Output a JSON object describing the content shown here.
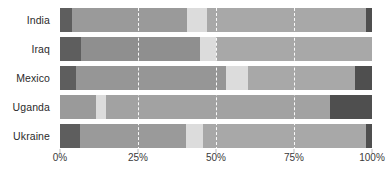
{
  "chart_data": {
    "type": "bar",
    "orientation": "horizontal",
    "stacked": true,
    "normalized": "100%",
    "title": "",
    "subtitle": "",
    "xlabel": "",
    "ylabel": "",
    "xlim": [
      0,
      100
    ],
    "xticks": [
      0,
      25,
      50,
      75,
      100
    ],
    "xticklabels": [
      "0%",
      "25%",
      "50%",
      "75%",
      "100%"
    ],
    "grid": "dashed white vertical gridlines at 25%, 50%, 75%",
    "legend": "none",
    "categories": [
      "India",
      "Iraq",
      "Mexico",
      "Uganda",
      "Ukraine"
    ],
    "series": [
      {
        "name": "Segment 1",
        "color": "#5e5e5e",
        "values": [
          3.8,
          6.7,
          5.1,
          0,
          6.4
        ]
      },
      {
        "name": "Segment 2",
        "color": "#9a9a9a",
        "values": [
          36.9,
          38.2,
          48.1,
          11.5,
          34.0
        ]
      },
      {
        "name": "Segment 3",
        "color": "#dcdcdc",
        "values": [
          6.4,
          5.1,
          7.1,
          3.2,
          5.4
        ]
      },
      {
        "name": "Segment 4",
        "color": "#a8a8a8",
        "values": [
          51.0,
          50.0,
          34.6,
          71.8,
          52.2
        ]
      },
      {
        "name": "Segment 5",
        "color": "#4f4f4f",
        "values": [
          1.9,
          0,
          5.1,
          13.5,
          2.0
        ]
      }
    ],
    "bars": [
      {
        "category": "India",
        "segments": [
          {
            "series": "Segment 1",
            "value": 3.8,
            "start": 0,
            "end": 3.8,
            "color": "#5e5e5e"
          },
          {
            "series": "Segment 2",
            "value": 36.9,
            "start": 3.8,
            "end": 40.7,
            "color": "#9a9a9a"
          },
          {
            "series": "Segment 3",
            "value": 6.4,
            "start": 40.7,
            "end": 47.1,
            "color": "#dcdcdc"
          },
          {
            "series": "Segment 4",
            "value": 51.0,
            "start": 47.1,
            "end": 98.1,
            "color": "#a8a8a8"
          },
          {
            "series": "Segment 5",
            "value": 1.9,
            "start": 98.1,
            "end": 100,
            "color": "#4f4f4f"
          }
        ]
      },
      {
        "category": "Iraq",
        "segments": [
          {
            "series": "Segment 1",
            "value": 6.7,
            "start": 0,
            "end": 6.7,
            "color": "#5e5e5e"
          },
          {
            "series": "Segment 2",
            "value": 38.2,
            "start": 6.7,
            "end": 44.9,
            "color": "#8f8f8f"
          },
          {
            "series": "Segment 3",
            "value": 5.1,
            "start": 44.9,
            "end": 50.0,
            "color": "#dcdcdc"
          },
          {
            "series": "Segment 4",
            "value": 50.0,
            "start": 50.0,
            "end": 100,
            "color": "#a8a8a8"
          },
          {
            "series": "Segment 5",
            "value": 0,
            "start": 100,
            "end": 100,
            "color": "#4f4f4f"
          }
        ]
      },
      {
        "category": "Mexico",
        "segments": [
          {
            "series": "Segment 1",
            "value": 5.1,
            "start": 0,
            "end": 5.1,
            "color": "#5e5e5e"
          },
          {
            "series": "Segment 2",
            "value": 48.1,
            "start": 5.1,
            "end": 53.2,
            "color": "#969696"
          },
          {
            "series": "Segment 3",
            "value": 7.1,
            "start": 53.2,
            "end": 60.3,
            "color": "#dcdcdc"
          },
          {
            "series": "Segment 4",
            "value": 34.3,
            "start": 60.3,
            "end": 94.6,
            "color": "#a8a8a8"
          },
          {
            "series": "Segment 5",
            "value": 5.4,
            "start": 94.6,
            "end": 100,
            "color": "#4f4f4f"
          }
        ]
      },
      {
        "category": "Uganda",
        "segments": [
          {
            "series": "Segment 1",
            "value": 0,
            "start": 0,
            "end": 0,
            "color": "#5e5e5e"
          },
          {
            "series": "Segment 2",
            "value": 11.5,
            "start": 0,
            "end": 11.5,
            "color": "#9a9a9a"
          },
          {
            "series": "Segment 3",
            "value": 3.2,
            "start": 11.5,
            "end": 14.7,
            "color": "#dcdcdc"
          },
          {
            "series": "Segment 4",
            "value": 71.8,
            "start": 14.7,
            "end": 86.5,
            "color": "#a2a2a2"
          },
          {
            "series": "Segment 5",
            "value": 13.5,
            "start": 86.5,
            "end": 100,
            "color": "#4f4f4f"
          }
        ]
      },
      {
        "category": "Ukraine",
        "segments": [
          {
            "series": "Segment 1",
            "value": 6.4,
            "start": 0,
            "end": 6.4,
            "color": "#5e5e5e"
          },
          {
            "series": "Segment 2",
            "value": 34.0,
            "start": 6.4,
            "end": 40.4,
            "color": "#9a9a9a"
          },
          {
            "series": "Segment 3",
            "value": 5.4,
            "start": 40.4,
            "end": 45.8,
            "color": "#dcdcdc"
          },
          {
            "series": "Segment 4",
            "value": 52.2,
            "start": 45.8,
            "end": 98.0,
            "color": "#a8a8a8"
          },
          {
            "series": "Segment 5",
            "value": 2.0,
            "start": 98.0,
            "end": 100,
            "color": "#4f4f4f"
          }
        ]
      }
    ]
  },
  "colors": {
    "background": "#ffffff",
    "gridline": "#ffffff",
    "tick_text": "#3a3a3a",
    "category_text": "#2b2b2b",
    "dark": "#5e5e5e",
    "medium": "#9a9a9a",
    "light": "#dcdcdc",
    "mid_light": "#a8a8a8",
    "darkest": "#4f4f4f"
  }
}
